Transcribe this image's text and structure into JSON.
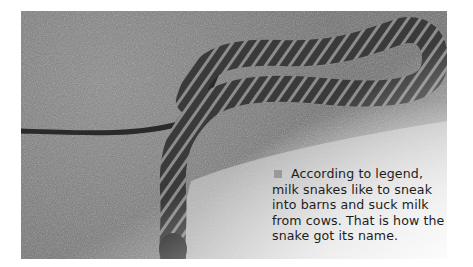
{
  "photo": {
    "subject": "milk snake on granite rock",
    "style": "grayscale photograph"
  },
  "caption": {
    "bullet_icon": "square-bullet",
    "bullet_color": "#9a9a9a",
    "text": "According to legend, milk snakes like to sneak into barns and suck milk from cows. That is how the snake got its name."
  }
}
